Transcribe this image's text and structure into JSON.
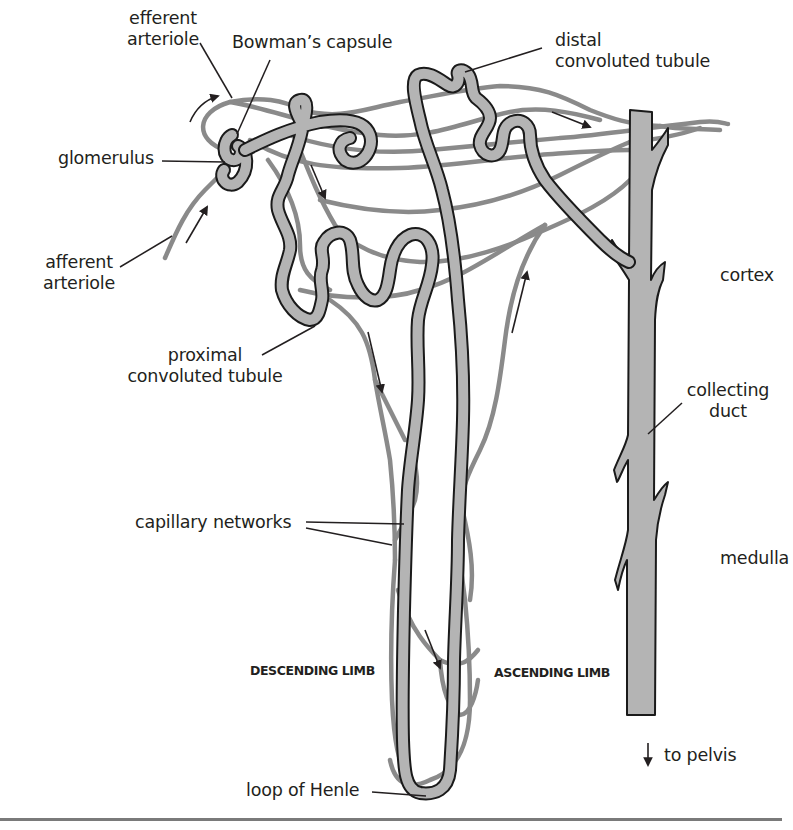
{
  "figure": {
    "labels": {
      "efferent_arteriole": [
        "efferent",
        "arteriole"
      ],
      "bowmans_capsule": "Bowman’s capsule",
      "glomerulus": "glomerulus",
      "afferent_arteriole": [
        "afferent",
        "arteriole"
      ],
      "distal_convoluted_tubule": [
        "distal",
        "convoluted tubule"
      ],
      "cortex": "cortex",
      "proximal_convoluted_tubule": [
        "proximal",
        "convoluted tubule"
      ],
      "collecting_duct": [
        "collecting",
        "duct"
      ],
      "capillary_networks": "capillary networks",
      "medulla": "medulla",
      "descending_limb": "DESCENDING LIMB",
      "ascending_limb": "ASCENDING LIMB",
      "to_pelvis": "to pelvis",
      "loop_of_henle": "loop of Henle"
    },
    "colors": {
      "tubule_fill": "#b4b4b4",
      "tubule_outline": "#1a1a1a",
      "capillary": "#8a8a8a",
      "text": "#231f20",
      "bottom_rule": "#7a7a7a"
    }
  }
}
